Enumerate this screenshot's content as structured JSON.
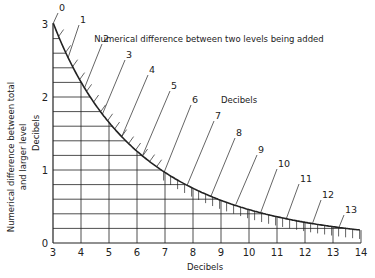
{
  "chart_data": {
    "type": "line",
    "title": "Numerical difference between two levels being added",
    "curve_label_unit": "Decibels",
    "xlabel": "Decibels",
    "ylabel_line1": "Numerical difference between total",
    "ylabel_line2": "and larger level",
    "ylabel_unit": "Decibels",
    "xlim": [
      3,
      14
    ],
    "ylim": [
      0,
      3
    ],
    "x_ticks": [
      "3",
      "4",
      "5",
      "6",
      "7",
      "8",
      "9",
      "10",
      "11",
      "12",
      "13",
      "14"
    ],
    "y_ticks": [
      "0",
      "1",
      "2",
      "3"
    ],
    "grid": {
      "x_step": 1,
      "y_step": 0.2
    },
    "series": [
      {
        "name": "Level difference",
        "points": [
          {
            "label": "0",
            "x": 3.01,
            "y": 3.01
          },
          {
            "label": "1",
            "x": 3.54,
            "y": 2.54
          },
          {
            "label": "2",
            "x": 4.12,
            "y": 2.12
          },
          {
            "label": "3",
            "x": 4.76,
            "y": 1.76
          },
          {
            "label": "4",
            "x": 5.46,
            "y": 1.46
          },
          {
            "label": "5",
            "x": 6.19,
            "y": 1.19
          },
          {
            "label": "6",
            "x": 6.97,
            "y": 0.97
          },
          {
            "label": "7",
            "x": 7.79,
            "y": 0.79
          },
          {
            "label": "8",
            "x": 8.64,
            "y": 0.64
          },
          {
            "label": "9",
            "x": 9.51,
            "y": 0.51
          },
          {
            "label": "10",
            "x": 10.41,
            "y": 0.41
          },
          {
            "label": "11",
            "x": 11.33,
            "y": 0.33
          },
          {
            "label": "12",
            "x": 12.27,
            "y": 0.27
          },
          {
            "label": "13",
            "x": 13.21,
            "y": 0.21
          }
        ],
        "end_point": {
          "x": 14,
          "y": 0.18
        }
      }
    ]
  },
  "colors": {
    "ink": "#222222",
    "background": "#ffffff"
  }
}
